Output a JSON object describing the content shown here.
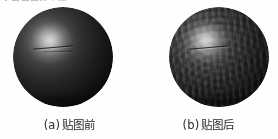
{
  "figure": {
    "background_color": "#fefefe",
    "top_cropped_text": "字面面面分布图",
    "panels": [
      {
        "id": "a",
        "caption_label": "(a)",
        "caption_text": "贴图前",
        "object": "sphere",
        "description": "untextured-sphere",
        "base_color": "#242424",
        "highlight_color": "#e8e8e8",
        "textured": false
      },
      {
        "id": "b",
        "caption_label": "(b)",
        "caption_text": "贴图后",
        "object": "sphere",
        "description": "texture-mapped-sphere",
        "base_color": "#242424",
        "highlight_color": "#e8e8e8",
        "textured": true
      }
    ]
  }
}
